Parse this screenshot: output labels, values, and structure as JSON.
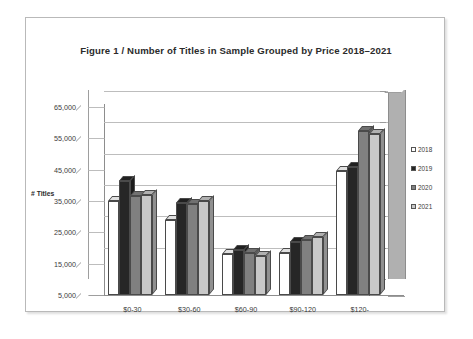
{
  "figure": {
    "title": "Figure 1  /  Number of Titles in Sample Grouped by Price 2018–2021"
  },
  "chart_data": {
    "type": "bar",
    "title": "Figure 1  /  Number of Titles in Sample Grouped by Price 2018–2021",
    "xlabel": "",
    "ylabel": "# Titles",
    "categories": [
      "$0-30",
      "$30-60",
      "$60-90",
      "$90-120",
      "$120-"
    ],
    "series": [
      {
        "name": "2018",
        "color": "#ffffff",
        "values": [
          35000,
          29000,
          18000,
          18500,
          44500
        ]
      },
      {
        "name": "2019",
        "color": "#262626",
        "values": [
          41500,
          34500,
          19500,
          22000,
          46000
        ]
      },
      {
        "name": "2020",
        "color": "#808080",
        "values": [
          36500,
          34000,
          18500,
          22500,
          57500
        ]
      },
      {
        "name": "2021",
        "color": "#c8c8c8",
        "values": [
          37000,
          35000,
          17500,
          23500,
          56500
        ]
      }
    ],
    "ylim": [
      5000,
      65000
    ],
    "yticks": [
      "5,000",
      "15,000",
      "25,000",
      "35,000",
      "45,000",
      "55,000",
      "65,000"
    ],
    "ytick_values": [
      5000,
      15000,
      25000,
      35000,
      45000,
      55000,
      65000
    ],
    "grid": true,
    "legend_position": "right",
    "style": "3d-clustered-column"
  }
}
